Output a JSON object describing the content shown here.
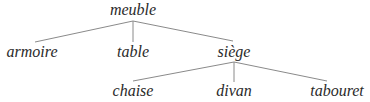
{
  "diagram": {
    "type": "tree",
    "root": {
      "label": "meuble",
      "x": 133,
      "y": 3,
      "junction": {
        "x": 133,
        "y": 21
      },
      "children": [
        {
          "label": "armoire",
          "x": 32,
          "y": 44,
          "edge_end": {
            "x": 35,
            "y": 42
          }
        },
        {
          "label": "table",
          "x": 133,
          "y": 44,
          "edge_end": {
            "x": 133,
            "y": 42
          }
        },
        {
          "label": "siège",
          "x": 234,
          "y": 44,
          "edge_end": {
            "x": 233,
            "y": 41
          },
          "junction": {
            "x": 234,
            "y": 62
          },
          "children": [
            {
              "label": "chaise",
              "x": 133,
              "y": 83,
              "edge_end": {
                "x": 133,
                "y": 81
              }
            },
            {
              "label": "divan",
              "x": 234,
              "y": 83,
              "edge_end": {
                "x": 234,
                "y": 82
              }
            },
            {
              "label": "tabouret",
              "x": 337,
              "y": 83,
              "edge_end": {
                "x": 327,
                "y": 81
              }
            }
          ]
        }
      ]
    },
    "edge_color": "#8a8a8a",
    "text_color": "#2a2a2a"
  },
  "labels": {
    "root": "meuble",
    "l1_0": "armoire",
    "l1_1": "table",
    "l1_2": "siège",
    "l2_0": "chaise",
    "l2_1": "divan",
    "l2_2": "tabouret"
  }
}
